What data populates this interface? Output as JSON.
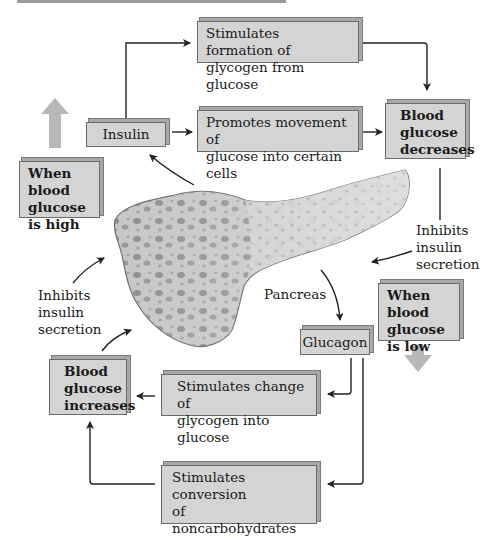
{
  "diagram": {
    "nodes": {
      "stim_glycogen_formation": "Stimulates formation of\nglycogen from glucose",
      "insulin": "Insulin",
      "promotes_movement": "Promotes movement of\nglucose into certain cells",
      "bg_decreases": "Blood\nglucose\ndecreases",
      "when_high": "When blood\nglucose\nis high",
      "inhibits_right": "Inhibits\ninsulin\nsecretion",
      "inhibits_left": "Inhibits\ninsulin\nsecretion",
      "pancreas": "Pancreas",
      "when_low": "When blood\nglucose\nis low",
      "glucagon": "Glucagon",
      "bg_increases": "Blood\nglucose\nincreases",
      "stim_glycogen_change": "Stimulates change of\nglycogen into glucose",
      "stim_conversion": "Stimulates conversion\nof noncarbohydrates\ninto glucose"
    },
    "edges": [
      {
        "from": "insulin",
        "to": "stim_glycogen_formation"
      },
      {
        "from": "insulin",
        "to": "promotes_movement"
      },
      {
        "from": "stim_glycogen_formation",
        "to": "bg_decreases"
      },
      {
        "from": "promotes_movement",
        "to": "bg_decreases"
      },
      {
        "from": "bg_decreases",
        "to": "pancreas",
        "label": "inhibits_right"
      },
      {
        "from": "pancreas",
        "to": "insulin"
      },
      {
        "from": "pancreas",
        "to": "glucagon"
      },
      {
        "from": "glucagon",
        "to": "stim_glycogen_change"
      },
      {
        "from": "glucagon",
        "to": "stim_conversion"
      },
      {
        "from": "stim_glycogen_change",
        "to": "bg_increases"
      },
      {
        "from": "stim_conversion",
        "to": "bg_increases"
      },
      {
        "from": "bg_increases",
        "to": "pancreas",
        "label": "inhibits_left"
      }
    ],
    "colors": {
      "box_fill": "#d4d4d4",
      "box_border": "#6a6a6a",
      "big_arrow": "#b8b8b8",
      "pancreas_fill": "#c4c4c4",
      "pancreas_spots": "#8e8e8e",
      "line": "#222222"
    }
  }
}
